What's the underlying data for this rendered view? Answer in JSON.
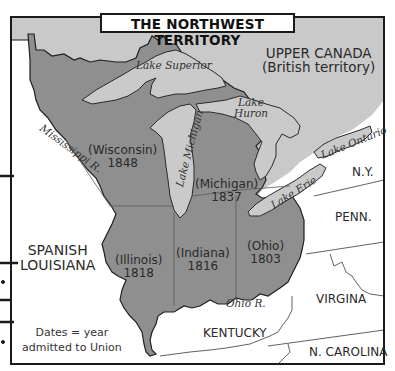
{
  "map": {
    "title": "THE NORTHWEST TERRITORY",
    "regions": {
      "upper_canada": {
        "line1": "UPPER CANADA",
        "line2": "(British territory)"
      },
      "spanish_louisiana": {
        "line1": "SPANISH",
        "line2": "LOUISIANA"
      }
    },
    "states": [
      {
        "name": "(Wisconsin)",
        "year": "1848"
      },
      {
        "name": "(Michigan)",
        "year": "1837"
      },
      {
        "name": "(Illinois)",
        "year": "1818"
      },
      {
        "name": "(Indiana)",
        "year": "1816"
      },
      {
        "name": "(Ohio)",
        "year": "1803"
      }
    ],
    "neighbors": {
      "ny": "N.Y.",
      "penn": "PENN.",
      "virgina": "VIRGINA",
      "kentucky": "KENTUCKY",
      "n_carolina": "N. CAROLINA"
    },
    "water": {
      "lake_superior": "Lake Superior",
      "lake_michigan": "Lake Michigan",
      "lake_huron_1": "Lake",
      "lake_huron_2": "Huron",
      "lake_erie": "Lake Erie",
      "lake_ontario": "Lake Ontario",
      "mississippi": "Mississippi R.",
      "ohio_river": "Ohio R."
    },
    "legend": {
      "line1": "Dates = year",
      "line2": "admitted to Union"
    },
    "colors": {
      "territory": "#8f8f8f",
      "canada": "#c9c9c9",
      "lakes": "#cacaca",
      "outside": "#ffffff",
      "border": "#1a1a1a"
    }
  }
}
